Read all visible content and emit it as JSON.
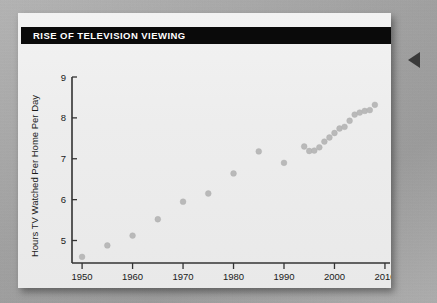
{
  "card": {
    "title": "RISE OF TELEVISION VIEWING"
  },
  "chart_data": {
    "type": "scatter",
    "title": "RISE OF TELEVISION VIEWING",
    "xlabel": "Year",
    "ylabel": "Hours TV Watched Per Home Per Day",
    "xlim": [
      1948,
      2011
    ],
    "ylim": [
      4.45,
      9.0
    ],
    "xticks": [
      1950,
      1960,
      1970,
      1980,
      1990,
      2000,
      2010
    ],
    "xticklabels": [
      "1950",
      "1960",
      "1970",
      "1980",
      "1990",
      "2000",
      "2010"
    ],
    "yticks": [
      5,
      6,
      7,
      8,
      9
    ],
    "yticklabels": [
      "5",
      "6",
      "7",
      "8",
      "9"
    ],
    "grid": false,
    "legend": false,
    "marker_color": "#b9b9b9",
    "series": [
      {
        "name": "Hours TV watched per home per day",
        "x": [
          1950,
          1955,
          1960,
          1965,
          1970,
          1975,
          1980,
          1985,
          1990,
          1994,
          1995,
          1996,
          1997,
          1998,
          1999,
          2000,
          2001,
          2002,
          2003,
          2004,
          2005,
          2006,
          2007,
          2008
        ],
        "values": [
          4.6,
          4.88,
          5.12,
          5.52,
          5.95,
          6.15,
          6.64,
          7.18,
          6.9,
          7.3,
          7.19,
          7.2,
          7.28,
          7.42,
          7.52,
          7.63,
          7.74,
          7.78,
          7.93,
          8.08,
          8.13,
          8.17,
          8.19,
          8.32
        ]
      }
    ]
  },
  "edge_marker": {
    "name": "left-pointing-triangle"
  }
}
